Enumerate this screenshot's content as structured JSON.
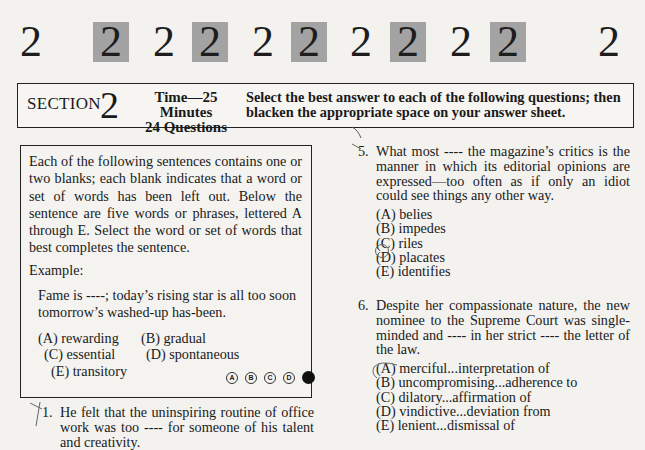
{
  "header_row": {
    "digits": [
      "2",
      "2",
      "2",
      "2",
      "2",
      "2",
      "2",
      "2",
      "2",
      "2",
      "2"
    ]
  },
  "section_header": {
    "label": "SECTION",
    "number": "2",
    "time": "Time—25 Minutes",
    "questions": "24 Questions",
    "instructions": "Select the best answer to each of the following questions; then blacken the appropriate space on your answer sheet."
  },
  "directions": {
    "text": "Each of the following sentences contains one or two blanks; each blank indicates that a word or set of words has been left out. Below the sentence are five words or phrases, lettered A through E. Select the word or set of words that best completes the sentence.",
    "example_label": "Example:",
    "example_sentence": "Fame is ----; today’s rising star is all too soon tomorrow’s washed-up has-been.",
    "example_choices": [
      "(A) rewarding",
      "(B) gradual",
      "(C) essential",
      "(D) spontaneous",
      "(E) transitory"
    ],
    "answer_bubbles": [
      "A",
      "B",
      "C",
      "D",
      "E"
    ],
    "filled_answer": "E"
  },
  "questions": [
    {
      "number": "1.",
      "text": "He felt that the uninspiring routine of office work was too ---- for someone of his talent and creativity.",
      "choices": []
    },
    {
      "number": "5.",
      "text": "What most ---- the magazine’s critics is the manner in which its editorial opinions are expressed—too often as if only an idiot could see things any other way.",
      "choices": [
        "(A) belies",
        "(B) impedes",
        "(C) riles",
        "(D) placates",
        "(E) identifies"
      ],
      "circled": "C"
    },
    {
      "number": "6.",
      "text": "Despite her compassionate nature, the new nominee to the Supreme Court was single-minded and ---- in her strict ---- the letter of the law.",
      "choices": [
        "(A) merciful...interpretation of",
        "(B) uncompromising...adherence to",
        "(C) dilatory...affirmation of",
        "(D) vindictive...deviation from",
        "(E) lenient...dismissal of"
      ],
      "circled": "B"
    }
  ],
  "colors": {
    "page": "#f3f2ef",
    "grey_box": "#a3a3a3",
    "ink": "#1a1a1a",
    "pencil": "#555555"
  }
}
